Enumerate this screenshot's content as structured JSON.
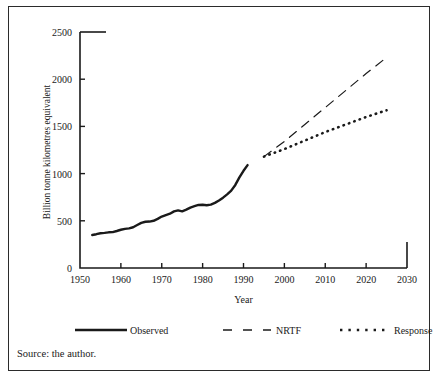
{
  "figure": {
    "source_note": "Source: the author."
  },
  "chart_data": {
    "type": "line",
    "title": "",
    "xlabel": "Year",
    "ylabel": "Billion tonne kilometres equivalent",
    "xlim": [
      1950,
      2030
    ],
    "ylim": [
      0,
      2500
    ],
    "xticks": [
      1950,
      1960,
      1970,
      1980,
      1990,
      2000,
      2010,
      2020,
      2030
    ],
    "xtick_labels": [
      "1950",
      "1960",
      "1970",
      "1980",
      "1990",
      "2000",
      "2010",
      "2020",
      "2030"
    ],
    "yticks": [
      0,
      500,
      1000,
      1500,
      2000,
      2500
    ],
    "ytick_labels": [
      "0",
      "500",
      "1000",
      "1500",
      "2000",
      "2500"
    ],
    "grid": false,
    "legend_position": "below-axes",
    "series": [
      {
        "name": "Observed",
        "style": "solid",
        "linewidth": 2.4,
        "color": "#1a1a1a",
        "x": [
          1953,
          1954,
          1955,
          1956,
          1957,
          1958,
          1959,
          1960,
          1961,
          1962,
          1963,
          1964,
          1965,
          1966,
          1967,
          1968,
          1969,
          1970,
          1971,
          1972,
          1973,
          1974,
          1975,
          1976,
          1977,
          1978,
          1979,
          1980,
          1981,
          1982,
          1983,
          1984,
          1985,
          1986,
          1987,
          1988,
          1989,
          1990,
          1991
        ],
        "values": [
          350,
          358,
          368,
          372,
          378,
          380,
          392,
          405,
          415,
          420,
          432,
          455,
          478,
          490,
          492,
          500,
          520,
          545,
          560,
          575,
          600,
          610,
          600,
          618,
          640,
          655,
          668,
          670,
          665,
          672,
          690,
          715,
          745,
          780,
          820,
          880,
          960,
          1030,
          1090
        ]
      },
      {
        "name": "NRTF",
        "style": "dashed",
        "linewidth": 1.2,
        "color": "#1a1a1a",
        "x": [
          1995,
          2000,
          2005,
          2010,
          2015,
          2020,
          2025
        ],
        "values": [
          1180,
          1340,
          1520,
          1700,
          1880,
          2060,
          2230
        ]
      },
      {
        "name": "Response",
        "style": "dotted",
        "linewidth": 2.6,
        "color": "#1a1a1a",
        "x": [
          1995,
          2000,
          2005,
          2010,
          2015,
          2020,
          2025
        ],
        "values": [
          1180,
          1260,
          1350,
          1440,
          1520,
          1600,
          1670
        ]
      }
    ]
  },
  "legend": {
    "items": [
      {
        "label": "Observed",
        "style": "solid"
      },
      {
        "label": "NRTF",
        "style": "dashed"
      },
      {
        "label": "Response",
        "style": "dotted"
      }
    ]
  }
}
